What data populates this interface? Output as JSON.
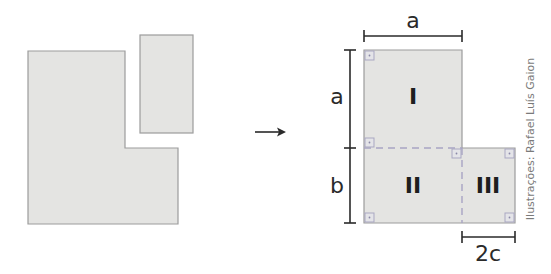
{
  "figure": {
    "type": "geometric decomposition diagram",
    "before": {
      "description": "L-shaped region and separate rectangle"
    },
    "after": {
      "dimension_labels": {
        "top_width": "a",
        "left_upper_height": "a",
        "left_lower_height": "b",
        "bottom_right_width": "2c"
      },
      "regions": [
        {
          "id": "I",
          "label": "I"
        },
        {
          "id": "II",
          "label": "II"
        },
        {
          "id": "III",
          "label": "III"
        }
      ]
    },
    "credit": "Ilustrações: Rafael Luís Gaion"
  },
  "colors": {
    "shape_fill": "#e4e4e2",
    "shape_stroke": "#9c9c9c",
    "dashed_divider": "#a8a4c4",
    "right_angle_marker": "#a9a7c2",
    "ink": "#2a2a2a"
  }
}
